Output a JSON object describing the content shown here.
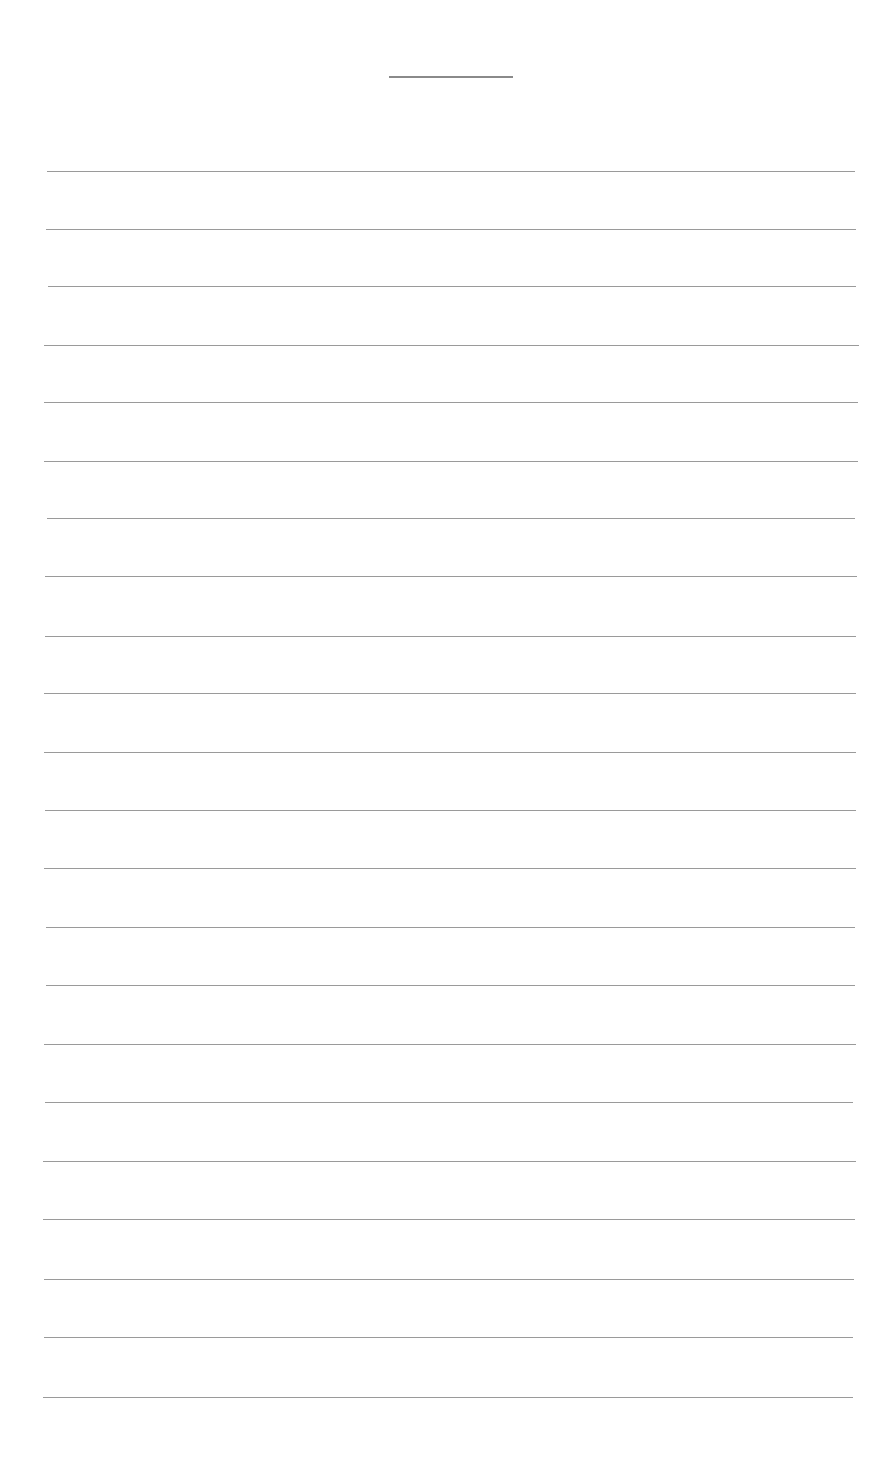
{
  "page": {
    "title_text": "",
    "title_rule": {
      "x": 389,
      "y": 76,
      "width": 124
    },
    "line_color": "#9a9a9a",
    "lines": [
      {
        "y": 171,
        "x1": 47,
        "x2": 855
      },
      {
        "y": 229,
        "x1": 46,
        "x2": 856
      },
      {
        "y": 286,
        "x1": 48,
        "x2": 856
      },
      {
        "y": 345,
        "x1": 44,
        "x2": 859
      },
      {
        "y": 402,
        "x1": 44,
        "x2": 858
      },
      {
        "y": 461,
        "x1": 44,
        "x2": 858
      },
      {
        "y": 518,
        "x1": 47,
        "x2": 855
      },
      {
        "y": 576,
        "x1": 45,
        "x2": 857
      },
      {
        "y": 636,
        "x1": 45,
        "x2": 856
      },
      {
        "y": 693,
        "x1": 44,
        "x2": 856
      },
      {
        "y": 752,
        "x1": 44,
        "x2": 856
      },
      {
        "y": 810,
        "x1": 45,
        "x2": 856
      },
      {
        "y": 868,
        "x1": 44,
        "x2": 856
      },
      {
        "y": 927,
        "x1": 46,
        "x2": 855
      },
      {
        "y": 985,
        "x1": 46,
        "x2": 855
      },
      {
        "y": 1044,
        "x1": 44,
        "x2": 856
      },
      {
        "y": 1102,
        "x1": 45,
        "x2": 853
      },
      {
        "y": 1161,
        "x1": 43,
        "x2": 856
      },
      {
        "y": 1219,
        "x1": 43,
        "x2": 855
      },
      {
        "y": 1279,
        "x1": 44,
        "x2": 854
      },
      {
        "y": 1337,
        "x1": 44,
        "x2": 853
      },
      {
        "y": 1397,
        "x1": 43,
        "x2": 853
      }
    ]
  }
}
